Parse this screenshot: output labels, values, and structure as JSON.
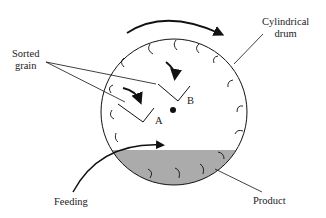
{
  "diagram": {
    "labels": {
      "sorted_grain": [
        "Sorted",
        "grain"
      ],
      "cylindrical_drum": [
        "Cylindrical",
        "drum"
      ],
      "trough_a": "A",
      "trough_b": "B",
      "feeding": "Feeding",
      "product": "Product"
    },
    "colors": {
      "stroke": "#111111",
      "product_fill": "#a9a9a9"
    }
  }
}
